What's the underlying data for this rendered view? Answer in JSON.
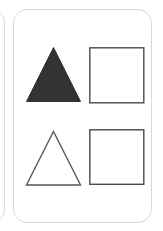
{
  "canvas": {
    "width": 163,
    "height": 231,
    "background_color": "#ffffff"
  },
  "cards": [
    {
      "id": "peek-card",
      "label": "partially-visible-card",
      "fully_visible": false,
      "background_color": "#ffffff",
      "border_color": "#d9d9d9",
      "corner_radius": 14,
      "shapes": []
    },
    {
      "id": "main-card",
      "label": "shape-card",
      "fully_visible": true,
      "background_color": "#ffffff",
      "border_color": "#d9d9d9",
      "corner_radius": 14,
      "shapes": [
        {
          "slot": "top-left",
          "shape": "triangle",
          "style": "filled",
          "fill_color": "#333333",
          "stroke_color": "#333333",
          "stroke_width": 1
        },
        {
          "slot": "top-right",
          "shape": "square",
          "style": "outlined",
          "fill_color": "#ffffff",
          "stroke_color": "#4a4a4a",
          "stroke_width": 1.4
        },
        {
          "slot": "bottom-left",
          "shape": "triangle",
          "style": "outlined",
          "fill_color": "#ffffff",
          "stroke_color": "#565656",
          "stroke_width": 1.4
        },
        {
          "slot": "bottom-right",
          "shape": "square",
          "style": "outlined",
          "fill_color": "#ffffff",
          "stroke_color": "#4a4a4a",
          "stroke_width": 1.4
        }
      ]
    }
  ],
  "icons": {
    "filled_triangle": "triangle-filled-icon",
    "outline_triangle": "triangle-outline-icon",
    "outline_square": "square-outline-icon"
  }
}
